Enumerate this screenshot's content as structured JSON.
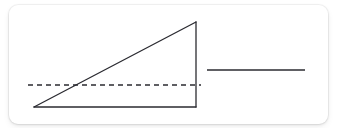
{
  "canvas": {
    "width": 338,
    "height": 128,
    "background_color": "#ffffff"
  },
  "card": {
    "name": "diagram-card",
    "x": 9,
    "y": 5,
    "width": 319,
    "height": 119,
    "corner_radius": 9,
    "background_color": "#ffffff",
    "border_color": "#e6e6e6"
  },
  "diagram": {
    "title": "",
    "stroke_color": "#2b2b31",
    "stroke_width": 1.3,
    "dash_stroke_color": "#2b2b31",
    "dash_pattern": "5 4",
    "shapes": [
      {
        "name": "right-triangle",
        "type": "polygon",
        "points": "34,107 196,22 196,107",
        "fill": "none",
        "vertices": {
          "bottom_left": [
            34,
            107
          ],
          "apex_top_right": [
            196,
            22
          ],
          "bottom_right": [
            196,
            107
          ]
        },
        "edges": [
          "hypotenuse",
          "vertical-right-leg",
          "horizontal-base"
        ]
      },
      {
        "name": "dashed-reference-line",
        "type": "line",
        "x1": 28,
        "y1": 85,
        "x2": 201,
        "y2": 85,
        "dashed": true
      },
      {
        "name": "solid-horizontal-segment",
        "type": "line",
        "x1": 207,
        "y1": 70,
        "x2": 305,
        "y2": 70,
        "dashed": false
      }
    ]
  }
}
